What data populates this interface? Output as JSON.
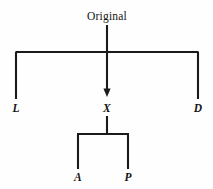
{
  "figure": {
    "kind": "tree-diagram",
    "background_color": "#fefefe",
    "stroke_color": "#1a1a1a",
    "width": 213,
    "height": 189,
    "root": {
      "id": "original",
      "label": "Original",
      "style": "upright",
      "x": 107,
      "y": 19
    },
    "level1": [
      {
        "id": "l",
        "label": "L",
        "style": "italic",
        "x": 16,
        "y": 110
      },
      {
        "id": "x",
        "label": "X",
        "style": "italic",
        "x": 107,
        "y": 110
      },
      {
        "id": "d",
        "label": "D",
        "style": "italic",
        "x": 198,
        "y": 110
      }
    ],
    "level2": [
      {
        "id": "a",
        "label": "A",
        "style": "italic",
        "x": 78,
        "y": 180
      },
      {
        "id": "p",
        "label": "P",
        "style": "italic",
        "x": 128,
        "y": 180
      }
    ],
    "edges": {
      "root_stem": {
        "x": 107,
        "y1": 25,
        "y2": 52
      },
      "top_bar": {
        "y": 52,
        "x1": 16,
        "x2": 198
      },
      "arrow_stem": {
        "x": 107,
        "y1": 52,
        "y2": 93
      },
      "left_leg": {
        "x": 16,
        "y1": 52,
        "y2": 99
      },
      "right_leg": {
        "x": 198,
        "y1": 52,
        "y2": 99
      },
      "x_stem": {
        "x": 107,
        "y1": 116,
        "y2": 134
      },
      "bottom_bar": {
        "y": 134,
        "x1": 78,
        "x2": 128
      },
      "a_leg": {
        "x": 78,
        "y1": 134,
        "y2": 169
      },
      "p_leg": {
        "x": 128,
        "y1": 134,
        "y2": 169
      }
    },
    "arrowhead": {
      "x": 107,
      "y": 95,
      "points_to": "x"
    }
  }
}
